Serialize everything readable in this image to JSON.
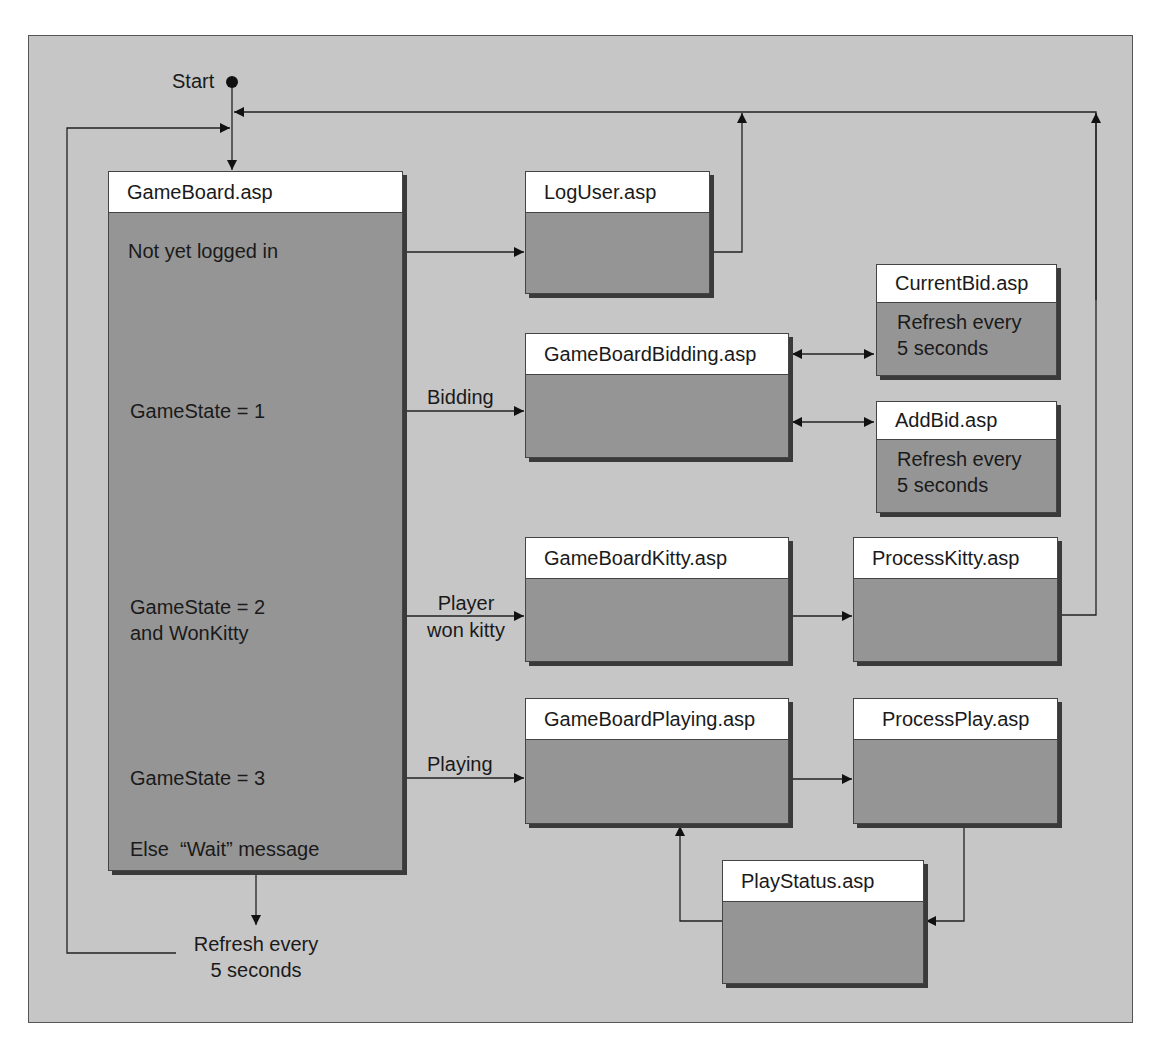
{
  "diagram": {
    "start_label": "Start",
    "gameboard": {
      "title": "GameBoard.asp",
      "conditions": [
        "Not yet logged in",
        "GameState = 1",
        "GameState = 2",
        "and WonKitty",
        "GameState = 3",
        "Else  “Wait” message"
      ]
    },
    "edge_labels": {
      "bidding": "Bidding",
      "player_won_kitty_1": "Player",
      "player_won_kitty_2": "won kitty",
      "playing": "Playing",
      "refresh_1": "Refresh every",
      "refresh_2": "5 seconds"
    },
    "pages": {
      "loguser": {
        "title": "LogUser.asp"
      },
      "bidding": {
        "title": "GameBoardBidding.asp"
      },
      "currentbid": {
        "title": "CurrentBid.asp",
        "note_1": "Refresh every",
        "note_2": "5 seconds"
      },
      "addbid": {
        "title": "AddBid.asp",
        "note_1": "Refresh every",
        "note_2": "5 seconds"
      },
      "kitty": {
        "title": "GameBoardKitty.asp"
      },
      "processkitty": {
        "title": "ProcessKitty.asp"
      },
      "playing": {
        "title": "GameBoardPlaying.asp"
      },
      "processplay": {
        "title": "ProcessPlay.asp"
      },
      "playstatus": {
        "title": "PlayStatus.asp"
      }
    },
    "colors": {
      "background": "#c6c6c6",
      "box_body": "#959595",
      "box_header": "#ffffff",
      "line": "#222222"
    }
  }
}
